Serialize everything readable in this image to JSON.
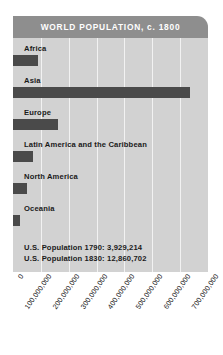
{
  "chart_data": {
    "type": "bar",
    "orientation": "horizontal",
    "title": "WORLD POPULATION, c. 1800",
    "xlabel": "",
    "ylabel": "",
    "xlim": [
      0,
      700000000
    ],
    "grid": true,
    "legend": "none",
    "categories": [
      "Africa",
      "Asia",
      "Europe",
      "Latin America and the Caribbean",
      "North America",
      "Oceania"
    ],
    "values": [
      90000000,
      635000000,
      160000000,
      70000000,
      50000000,
      25000000
    ],
    "tick_labels": [
      "0",
      "100,000,000",
      "200,000,000",
      "300,000,000",
      "400,000,000",
      "500,000,000",
      "600,000,000",
      "700,000,000"
    ],
    "tick_values": [
      0,
      100000000,
      200000000,
      300000000,
      400000000,
      500000000,
      600000000,
      700000000
    ],
    "annotations": [
      "U.S. Population 1790: 3,929,214",
      "U.S. Population 1830: 12,860,702"
    ],
    "colors": {
      "bar": "#4a4a4a",
      "header": "#8e8e8e",
      "plot_background": "#d2d2d2",
      "gridline": "#f2f2f2",
      "title_text": "#ffffff",
      "label_text": "#1a1a1a"
    }
  }
}
